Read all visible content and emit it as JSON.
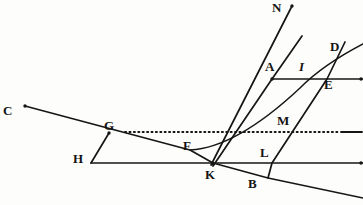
{
  "figure": {
    "background_color": "#fdfdfb",
    "ink_color": "#161616",
    "width": 363,
    "height": 205
  },
  "labels": [
    {
      "id": "C",
      "text": "C",
      "x": 3,
      "y": 104,
      "style": "upright"
    },
    {
      "id": "G",
      "text": "G",
      "x": 104,
      "y": 119,
      "style": "upright"
    },
    {
      "id": "H",
      "text": "H",
      "x": 73,
      "y": 152,
      "style": "upright"
    },
    {
      "id": "F",
      "text": "F",
      "x": 183,
      "y": 139,
      "style": "upright"
    },
    {
      "id": "K",
      "text": "K",
      "x": 205,
      "y": 168,
      "style": "upright"
    },
    {
      "id": "B",
      "text": "B",
      "x": 248,
      "y": 177,
      "style": "upright"
    },
    {
      "id": "L",
      "text": "L",
      "x": 260,
      "y": 146,
      "style": "upright"
    },
    {
      "id": "M",
      "text": "M",
      "x": 277,
      "y": 114,
      "style": "upright"
    },
    {
      "id": "N",
      "text": "N",
      "x": 272,
      "y": 1,
      "style": "upright"
    },
    {
      "id": "A",
      "text": "A",
      "x": 265,
      "y": 60,
      "style": "upright"
    },
    {
      "id": "I",
      "text": "I",
      "x": 299,
      "y": 60,
      "style": "italic"
    },
    {
      "id": "D",
      "text": "D",
      "x": 330,
      "y": 40,
      "style": "upright"
    },
    {
      "id": "E",
      "text": "E",
      "x": 324,
      "y": 78,
      "style": "upright"
    }
  ],
  "lines": [
    {
      "id": "ray-C-K-B",
      "name": "incident-ray-C-through-K-to-lower-right",
      "points": "25,106 190,150 213,163 268,178 363,198"
    },
    {
      "id": "baseline-H-K",
      "name": "horizontal-baseline-H-K-right",
      "points": "91,163 363,163"
    },
    {
      "id": "segment-G-H",
      "name": "segment-G-to-H",
      "points": "109,133 91,163"
    },
    {
      "id": "axis-A-I-E",
      "name": "horizontal-line-A-I-E-right",
      "points": "272,79 363,79"
    },
    {
      "id": "ray-K-N",
      "name": "steep-ray-K-to-N",
      "points": "211,165 292,6"
    },
    {
      "id": "ray-K-A-D",
      "name": "ray-K-through-A-toward-D",
      "points": "213,166 272,79 302,36"
    },
    {
      "id": "ray-B-L-E-D",
      "name": "ray-B-through-L-and-E-upward",
      "points": "268,178 272,163 327,79 345,42"
    }
  ],
  "curves": [
    {
      "id": "curve-F-I-D",
      "name": "refracted-curve-F-through-I-to-D",
      "path": "M 190,150 C 228,148 268,118 300,88 C 318,70 340,56 363,44"
    }
  ],
  "dotted_lines": [
    {
      "id": "dotted-G-M",
      "name": "dotted-horizontal-through-G-and-M",
      "x1": 125,
      "x2": 340,
      "y": 132
    }
  ],
  "dashes": [
    {
      "id": "dash-right-of-dotted",
      "name": "solid-dash-right-end-of-dotted-line",
      "x1": 341,
      "x2": 362,
      "y": 132
    }
  ],
  "dots": [
    {
      "id": "dot-N",
      "name": "endpoint-dot-N",
      "x": 292,
      "y": 6
    },
    {
      "id": "dot-C",
      "name": "endpoint-dot-C",
      "x": 25,
      "y": 106
    },
    {
      "id": "dot-A",
      "name": "point-dot-A",
      "x": 272,
      "y": 79
    },
    {
      "id": "dot-G",
      "name": "point-dot-G",
      "x": 109,
      "y": 133
    },
    {
      "id": "dot-K",
      "name": "point-dot-K",
      "x": 213,
      "y": 164
    },
    {
      "id": "dot-end-baseline",
      "name": "endpoint-dot-baseline-right",
      "x": 361,
      "y": 163
    },
    {
      "id": "dot-end-axis",
      "name": "endpoint-dot-axis-right",
      "x": 361,
      "y": 79
    }
  ]
}
